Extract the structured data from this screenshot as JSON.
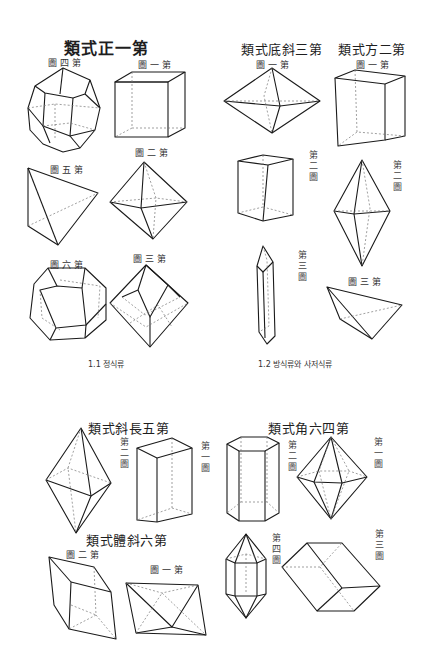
{
  "figure_1_1": {
    "title": "類式正一第",
    "caption": "1.1 정식류",
    "figures": [
      {
        "label": "圖四第",
        "shape": "cuboctahedral-polyhedron"
      },
      {
        "label": "圖一第",
        "shape": "cube"
      },
      {
        "label": "圖五第",
        "shape": "tetrahedron"
      },
      {
        "label": "圖二第",
        "shape": "octahedron"
      },
      {
        "label": "圖六第",
        "shape": "pentagonal-dodecahedron"
      },
      {
        "label": "圖三第",
        "shape": "rhombic-dodecahedron"
      }
    ]
  },
  "figure_1_2": {
    "caption": "1.2 방식류와 사저식류",
    "groups": [
      {
        "title": "類式底斜三第",
        "figures": [
          {
            "label": "圖一第",
            "shape": "bipyramid"
          },
          {
            "label": "第二圖",
            "shape": "rectangular-prism"
          },
          {
            "label": "第三圖",
            "shape": "elongated-prism"
          }
        ]
      },
      {
        "title": "類式方二第",
        "figures": [
          {
            "label": "圖一第",
            "shape": "tall-cuboid"
          },
          {
            "label": "第二圖",
            "shape": "tetragonal-bipyramid"
          },
          {
            "label": "圖三第",
            "shape": "sphenoid"
          }
        ]
      }
    ]
  },
  "figure_bottom_left": {
    "title": "類式斜長五第",
    "figures": [
      {
        "label": "第二圖",
        "shape": "rhombic-bipyramid"
      },
      {
        "label": "第一圖",
        "shape": "cuboid"
      }
    ],
    "subgroup": {
      "title": "類式體斜六第",
      "figures": [
        {
          "label": "圖二第",
          "shape": "rhombohedron"
        },
        {
          "label": "圖一第",
          "shape": "triclinic-pinacoid"
        }
      ]
    }
  },
  "figure_bottom_right": {
    "title": "類式角六四第",
    "figures": [
      {
        "label": "第二圖",
        "shape": "hexagonal-prism"
      },
      {
        "label": "第一圖",
        "shape": "hexagonal-bipyramid"
      },
      {
        "label": "第四圖",
        "shape": "hexagonal-prism-with-pyramids"
      },
      {
        "label": "第三圖",
        "shape": "rhombohedron"
      }
    ]
  }
}
